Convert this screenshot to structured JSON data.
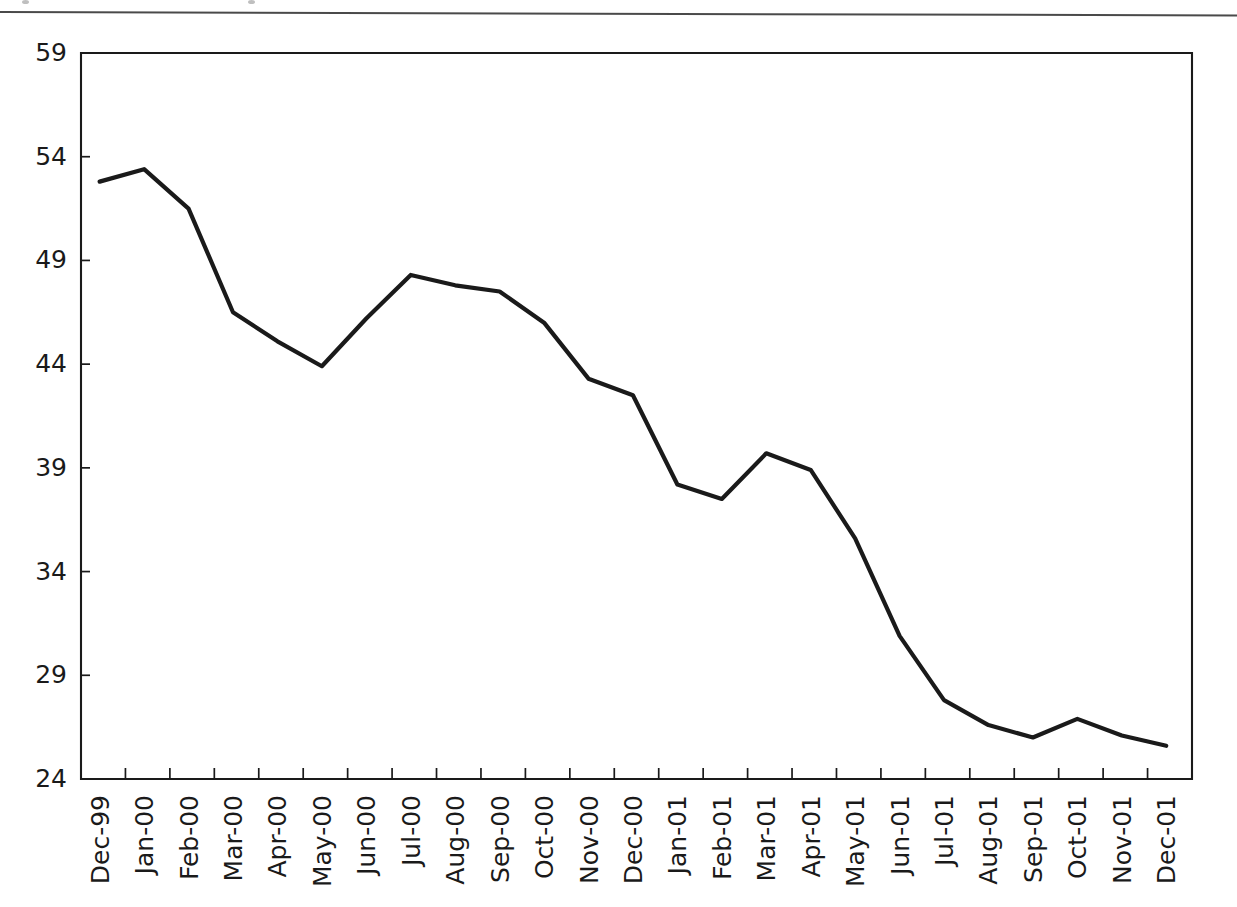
{
  "page": {
    "background": "#ffffff",
    "ink_color": "#1a1a1a",
    "top_rule": "horizontal-rule"
  },
  "chart_data": {
    "type": "line",
    "title": "",
    "subtitle": "",
    "xlabel": "",
    "ylabel": "",
    "categories": [
      "Dec-99",
      "Jan-00",
      "Feb-00",
      "Mar-00",
      "Apr-00",
      "May-00",
      "Jun-00",
      "Jul-00",
      "Aug-00",
      "Sep-00",
      "Oct-00",
      "Nov-00",
      "Dec-00",
      "Jan-01",
      "Feb-01",
      "Mar-01",
      "Apr-01",
      "May-01",
      "Jun-01",
      "Jul-01",
      "Aug-01",
      "Sep-01",
      "Oct-01",
      "Nov-01",
      "Dec-01"
    ],
    "values": [
      52.8,
      53.4,
      51.5,
      46.5,
      45.1,
      43.9,
      46.2,
      48.3,
      47.8,
      47.5,
      46.0,
      43.3,
      42.5,
      38.2,
      37.5,
      39.7,
      38.9,
      35.6,
      30.9,
      27.8,
      26.6,
      26.0,
      26.9,
      26.1,
      25.6
    ],
    "series": [
      {
        "name": "series-1",
        "color": "#1a1a1a",
        "values": [
          52.8,
          53.4,
          51.5,
          46.5,
          45.1,
          43.9,
          46.2,
          48.3,
          47.8,
          47.5,
          46.0,
          43.3,
          42.5,
          38.2,
          37.5,
          39.7,
          38.9,
          35.6,
          30.9,
          27.8,
          26.6,
          26.0,
          26.9,
          26.1,
          25.6
        ]
      }
    ],
    "yticks": [
      24,
      29,
      34,
      39,
      44,
      49,
      54,
      59
    ],
    "ylim": [
      24,
      59
    ],
    "ytick_step": 5,
    "xtick_labels_rotation": -90,
    "grid": false,
    "legend": false,
    "legend_position": "none",
    "markers": false,
    "annotations": []
  }
}
